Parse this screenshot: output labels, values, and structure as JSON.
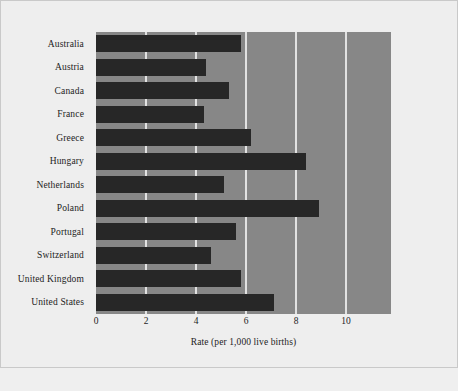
{
  "chart_data": {
    "type": "bar",
    "orientation": "horizontal",
    "title": "",
    "xlabel": "Rate (per 1,000 live births)",
    "ylabel": "",
    "xlim": [
      0,
      11.8
    ],
    "xticks": [
      0,
      2,
      4,
      6,
      8,
      10
    ],
    "grid": "vertical",
    "legend": "none",
    "categories": [
      "Australia",
      "Austria",
      "Canada",
      "France",
      "Greece",
      "Hungary",
      "Netherlands",
      "Poland",
      "Portugal",
      "Switzerland",
      "United Kingdom",
      "United States"
    ],
    "values": [
      5.8,
      4.4,
      5.3,
      4.3,
      6.2,
      8.4,
      5.1,
      8.9,
      5.6,
      4.6,
      5.8,
      7.1
    ],
    "colors": {
      "bar": "#272727",
      "plot_background": "#878787",
      "gridline": "#e2e2e2",
      "figure_background": "#eeeeee",
      "text": "#1d1d1d"
    }
  },
  "caption": {
    "text": ""
  }
}
